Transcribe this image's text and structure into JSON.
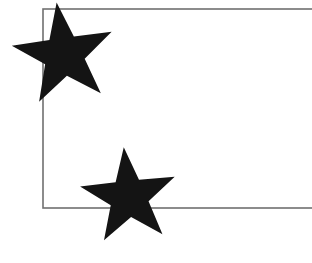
{
  "canvas": {
    "width": 312,
    "height": 263,
    "background_color": "#ffffff",
    "title": "Two black five-pointed stars overlapping a thin gray rectangle outline"
  },
  "shapes": {
    "rectangle": {
      "name": "rectangle-outline",
      "kind": "rectangle",
      "stroke_color": "#707070",
      "stroke_width": 1.6,
      "fill": "none",
      "x": 43,
      "y": 9,
      "width": 275,
      "height": 199,
      "cropped_at_right_edge": true,
      "note": "Top and bottom edges run off the right side of the image; right edge is not visible."
    },
    "stars": [
      {
        "name": "star-top-left",
        "kind": "star",
        "fill_color": "#141414",
        "points": 5,
        "center_x": 64,
        "center_y": 55,
        "outer_radius": 53,
        "inner_radius": 21,
        "rotation_deg": -8,
        "bbox": {
          "x": 15,
          "y": 3,
          "width": 98,
          "height": 102
        },
        "top_tip": {
          "x": 62,
          "y": 3
        },
        "left_tip": {
          "x": 15,
          "y": 45
        },
        "right_tip": {
          "x": 113,
          "y": 42
        },
        "bottom_extent_y": 105
      },
      {
        "name": "star-bottom-middle",
        "kind": "star",
        "fill_color": "#141414",
        "points": 5,
        "center_x": 129,
        "center_y": 197,
        "outer_radius": 50,
        "inner_radius": 20,
        "rotation_deg": -6,
        "bbox": {
          "x": 78,
          "y": 148,
          "width": 102,
          "height": 97
        },
        "top_tip": {
          "x": 128,
          "y": 148
        },
        "left_tip": {
          "x": 78,
          "y": 185
        },
        "right_tip": {
          "x": 180,
          "y": 183
        },
        "bottom_extent_y": 245
      }
    ]
  },
  "colors": {
    "star_black": "#141414",
    "rectangle_gray": "#707070",
    "background_white": "#ffffff"
  }
}
